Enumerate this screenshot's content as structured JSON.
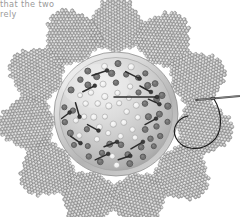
{
  "page": {
    "width": 240,
    "height": 217,
    "background_color": "#ffffff",
    "kind": "book-page-scan"
  },
  "body_text": {
    "name": "cut-off-paragraph",
    "lines": [
      "that the two",
      "rely"
    ],
    "text": "that the two\nrely",
    "color": "#9a9a9a",
    "note": "partial body copy cropped at left and top of the scanned page"
  },
  "figure": {
    "center_x": 116,
    "center_y": 114,
    "style": "greyscale halftone photograph / line illustration",
    "colors": {
      "bead_light": "#e2e2e2",
      "bead_mid": "#b5b5b5",
      "bead_dark": "#8d8d8d",
      "bead_outline": "#6f6f6f",
      "disc_light": "#e9e9e9",
      "disc_mid": "#c6c6c6",
      "disc_dark": "#9c9c9c",
      "disc_rim": "#f1f1f1",
      "hole_dark": "#6a6a6a",
      "hole_light": "#f4f4f4",
      "pin_color": "#2b2b2b",
      "thread_color": "#1e1e1e",
      "needle_color": "#555555"
    },
    "petals": {
      "name": "beaded-petal-ring",
      "count": 11,
      "shape": "hexagonal beaded cluster",
      "bead_rows_per_petal": 9,
      "ring_radius": 78,
      "petal_radius": 40,
      "angles_deg": [
        -90,
        -57,
        -24,
        9,
        42,
        75,
        108,
        141,
        174,
        207,
        240
      ]
    },
    "disc": {
      "name": "pincushion-disc",
      "radius": 62,
      "rim_width": 6,
      "hole_count": 96,
      "hole_rings": [
        {
          "radius": 12,
          "count": 6,
          "style": "light"
        },
        {
          "radius": 22,
          "count": 11,
          "style": "light"
        },
        {
          "radius": 32,
          "count": 15,
          "style": "mixed"
        },
        {
          "radius": 42,
          "count": 19,
          "style": "dark"
        },
        {
          "radius": 51,
          "count": 22,
          "style": "dark"
        }
      ]
    },
    "pins": {
      "name": "pin-markers",
      "count": 15,
      "description": "short dark bars with bead heads laid across the disc",
      "long_pin": {
        "x1": 114,
        "y1": 97,
        "x2": 157,
        "y2": 97,
        "length": 43
      }
    },
    "needle": {
      "name": "sewing-needle",
      "visible": true,
      "tip_x": 196,
      "tip_y": 100,
      "tail_x": 240,
      "tail_y": 96,
      "description": "straight needle entering from right edge, pointing left into petal"
    },
    "thread": {
      "name": "sewing-thread",
      "visible": true,
      "description": "dark thread looping down and left from the needle eye"
    }
  }
}
